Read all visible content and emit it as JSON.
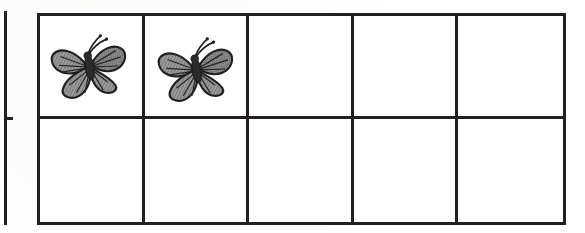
{
  "worksheet": {
    "title": "Ten frame with butterfly counters",
    "background_color": "#ffffff",
    "line_color": "#231f20"
  },
  "left_partial_grid": {
    "label": "partial adjacent grid edge",
    "edge_name": "vertical-rule",
    "tick_name": "row-divider-tick"
  },
  "ten_frame": {
    "name": "ten-frame-grid",
    "rows": 2,
    "columns": 5,
    "total_cells": 10,
    "border_color": "#231f20",
    "border_width_px": 3,
    "counter_icon": "butterfly-icon",
    "counter_label": "butterfly",
    "filled_count": 2,
    "empty_count": 8,
    "cells": [
      {
        "row": 1,
        "column": 1,
        "filled": true,
        "content": "butterfly"
      },
      {
        "row": 1,
        "column": 2,
        "filled": true,
        "content": "butterfly"
      },
      {
        "row": 1,
        "column": 3,
        "filled": false,
        "content": ""
      },
      {
        "row": 1,
        "column": 4,
        "filled": false,
        "content": ""
      },
      {
        "row": 1,
        "column": 5,
        "filled": false,
        "content": ""
      },
      {
        "row": 2,
        "column": 1,
        "filled": false,
        "content": ""
      },
      {
        "row": 2,
        "column": 2,
        "filled": false,
        "content": ""
      },
      {
        "row": 2,
        "column": 3,
        "filled": false,
        "content": ""
      },
      {
        "row": 2,
        "column": 4,
        "filled": false,
        "content": ""
      },
      {
        "row": 2,
        "column": 5,
        "filled": false,
        "content": ""
      }
    ]
  },
  "butterfly_art": {
    "name": "monarch-butterfly",
    "style": "grayscale halftone clipart",
    "wing_fill": "#9a9a9a",
    "wing_outline": "#231f20",
    "body_color": "#2b2b2b",
    "antennae": 2
  }
}
